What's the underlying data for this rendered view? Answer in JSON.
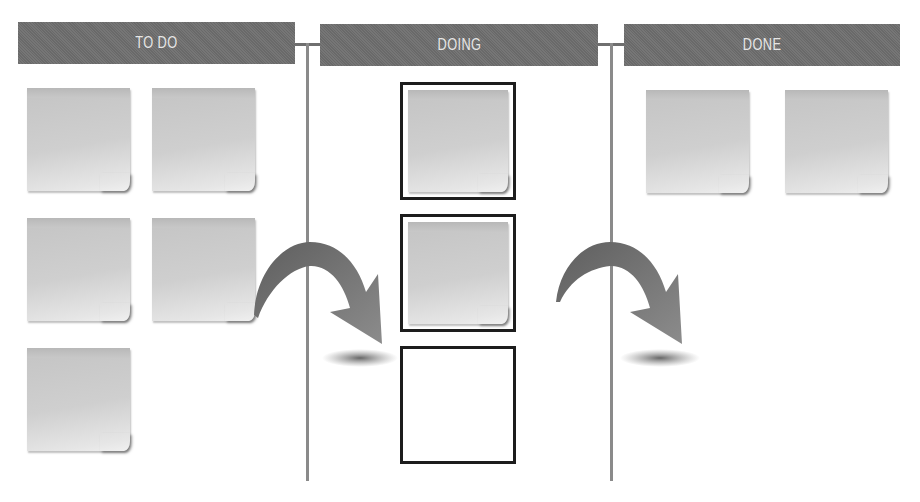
{
  "board": {
    "columns": [
      {
        "id": "todo",
        "title": "TO DO",
        "card_count": 5
      },
      {
        "id": "doing",
        "title": "DOING",
        "card_count": 2,
        "empty_slots": 1
      },
      {
        "id": "done",
        "title": "DONE",
        "card_count": 2
      }
    ],
    "arrows": [
      {
        "from": "todo",
        "to": "doing",
        "icon": "curved-arrow-icon"
      },
      {
        "from": "doing",
        "to": "done",
        "icon": "curved-arrow-icon"
      }
    ]
  },
  "colors": {
    "header_bg": "#6f6f6f",
    "header_text": "#e6e6e6",
    "divider": "#8a8a8a",
    "note": "#cccccc",
    "frame_border": "#1d1d1d",
    "arrow": "#7a7a7a"
  }
}
